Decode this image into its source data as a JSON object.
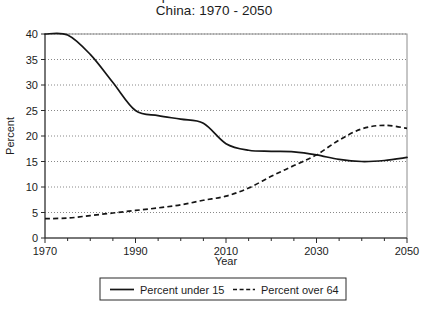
{
  "title": {
    "line1": "Percent of Population Under 15 and Over 64",
    "line2": "China: 1970 - 2050"
  },
  "axes": {
    "ylabel": "Percent",
    "xlabel": "Year",
    "y_ticks": [
      "0",
      "5",
      "10",
      "15",
      "20",
      "25",
      "30",
      "35",
      "40"
    ],
    "x_ticks": [
      "1970",
      "1990",
      "2010",
      "2030",
      "2050"
    ]
  },
  "legend": {
    "series1_label": "Percent under 15",
    "series2_label": "Percent over 64"
  },
  "chart_data": {
    "type": "line",
    "xlabel": "Year",
    "ylabel": "Percent",
    "xlim": [
      1970,
      2050
    ],
    "ylim": [
      0,
      40
    ],
    "y_ticks": [
      0,
      5,
      10,
      15,
      20,
      25,
      30,
      35,
      40
    ],
    "x_ticks": [
      1970,
      1990,
      2010,
      2030,
      2050
    ],
    "x_minor_tick_interval": 5,
    "grid": "horizontal-dotted",
    "legend_position": "below-plot",
    "series": [
      {
        "name": "Percent under 15",
        "style": "solid",
        "x": [
          1970,
          1975,
          1980,
          1985,
          1990,
          1995,
          2000,
          2005,
          2010,
          2015,
          2020,
          2025,
          2030,
          2035,
          2040,
          2045,
          2050
        ],
        "values": [
          40.0,
          39.8,
          36.0,
          30.5,
          25.0,
          24.0,
          23.3,
          22.5,
          18.5,
          17.2,
          17.0,
          16.9,
          16.3,
          15.4,
          15.0,
          15.2,
          15.8
        ]
      },
      {
        "name": "Percent over 64",
        "style": "dashed",
        "x": [
          1970,
          1975,
          1980,
          1985,
          1990,
          1995,
          2000,
          2005,
          2010,
          2015,
          2020,
          2025,
          2030,
          2035,
          2040,
          2045,
          2050
        ],
        "values": [
          3.8,
          3.9,
          4.4,
          4.9,
          5.4,
          5.9,
          6.5,
          7.4,
          8.2,
          9.8,
          12.1,
          14.2,
          16.3,
          19.2,
          21.4,
          22.1,
          21.5
        ]
      }
    ]
  }
}
